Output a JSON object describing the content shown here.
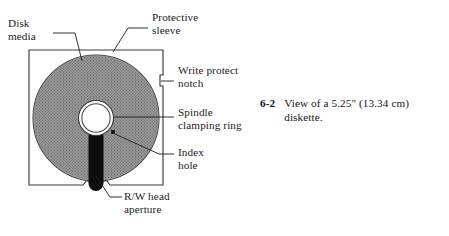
{
  "figure": {
    "caption_number": "6-2",
    "caption_text": "View of a 5.25\" (13.34 cm) diskette."
  },
  "labels": {
    "disk_media": "Disk\nmedia",
    "protective_sleeve": "Protective\nsleeve",
    "write_protect_notch": "Write protect\nnotch",
    "spindle_clamping_ring": "Spindle\nclamping ring",
    "index_hole": "Index\nhole",
    "rw_head_aperture": "R/W head\naperture"
  },
  "colors": {
    "page_background": "#ffffff",
    "ink": "#1a1a1a",
    "sleeve_outline": "#3a3a3a",
    "disk_media_fill": "#8c8c8c",
    "disk_media_edge": "#4a4a4a",
    "hub_hole_fill": "#fbfbfb",
    "aperture_fill": "#0d0d0d",
    "index_hole_fill": "#101010",
    "leader_line": "#2b2b2b"
  },
  "geometry": {
    "sleeve": {
      "x": 29,
      "y": 50,
      "width": 134,
      "height": 135
    },
    "disk": {
      "cx": 96,
      "cy": 118,
      "r": 63
    },
    "hub": {
      "cx": 96,
      "cy": 118,
      "r_outer": 17,
      "r_inner": 14.5
    },
    "index_hole": {
      "cx": 113,
      "cy": 132,
      "r": 2.2
    },
    "aperture": {
      "cx": 96,
      "cy": 160,
      "width": 15,
      "height": 62
    },
    "write_protect_notch": {
      "x": 160,
      "y": 75,
      "width": 7,
      "height": 11
    }
  }
}
